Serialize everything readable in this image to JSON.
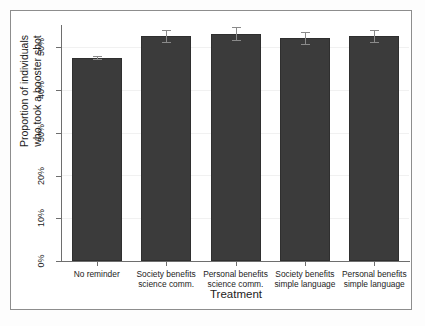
{
  "chart_data": {
    "type": "bar",
    "title": "",
    "xlabel": "Treatment",
    "ylabel": "Proportion of individuals who took a booster shot",
    "ylabel_lines": [
      "Proportion of individuals",
      "who took a booster shot"
    ],
    "categories": [
      "No reminder",
      "Society benefits science comm.",
      "Personal benefits science comm.",
      "Society benefits simple language",
      "Personal benefits simple language"
    ],
    "category_lines": [
      [
        "No reminder"
      ],
      [
        "Society benefits",
        "science comm."
      ],
      [
        "Personal benefits",
        "science comm."
      ],
      [
        "Society benefits",
        "simple language"
      ],
      [
        "Personal benefits",
        "simple language"
      ]
    ],
    "values": [
      47.5,
      52.6,
      53.1,
      52.1,
      52.6
    ],
    "error_low": [
      47.2,
      51.2,
      51.6,
      50.7,
      51.2
    ],
    "error_high": [
      47.8,
      54.0,
      54.6,
      53.5,
      54.0
    ],
    "ylim": [
      0,
      55
    ],
    "ytick_values": [
      0,
      10,
      20,
      30,
      40,
      50
    ],
    "ytick_labels": [
      "0%",
      "10%",
      "20%",
      "30%",
      "40%",
      "50%"
    ],
    "grid": true,
    "legend": "none",
    "bar_color": "#3b3b3b",
    "error_color": "#8a8a8a",
    "axis_color": "#6e6e6e",
    "grid_color": "#f1f1f1"
  }
}
